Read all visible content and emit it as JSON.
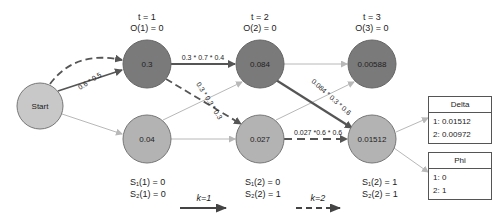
{
  "colors": {
    "dark_node": "#7a7a7a",
    "light_node": "#b3b3b3",
    "start_node": "#c8c8c8",
    "edge_strong": "#555555",
    "edge_faint": "#b8b8b8"
  },
  "nodes": {
    "start": {
      "label": "Start"
    },
    "t1_top": {
      "value": "0.3"
    },
    "t1_bottom": {
      "value": "0.04"
    },
    "t2_top": {
      "value": "0.084"
    },
    "t2_bottom": {
      "value": "0.027"
    },
    "t3_top": {
      "value": "0.00588"
    },
    "t3_bottom": {
      "value": "0.01512"
    }
  },
  "columns": [
    {
      "t": "t = 1",
      "o": "O(1) = 0",
      "s1": "S₁(1) = 0",
      "s2": "S₂(1) = 0"
    },
    {
      "t": "t = 2",
      "o": "O(2) = 0",
      "s1": "S₁(2) = 0",
      "s2": "S₂(2) = 1"
    },
    {
      "t": "t = 3",
      "o": "O(3) = 0",
      "s1": "S₁(2) = 1",
      "s2": "S₂(2) = 1"
    }
  ],
  "edge_labels": {
    "start_to_t1_top": "0.6 * 0.5",
    "t1_top_to_t2_top": "0.3 * 0.7 * 0.4",
    "t1_top_to_t2_bottom": "0.3 * 0.3 * 0.3",
    "t2_top_to_t3_bottom": "0.084 * 0.3 * 0.6",
    "t2_bottom_to_t3_bottom": "0.027 *0.6 * 0.6"
  },
  "legend": {
    "k1": "k=1",
    "k2": "k=2"
  },
  "delta": {
    "title": "Delta",
    "rows": [
      "1: 0.01512",
      "2: 0.00972"
    ]
  },
  "phi": {
    "title": "Phi",
    "rows": [
      "1: 0",
      "2: 1"
    ]
  }
}
